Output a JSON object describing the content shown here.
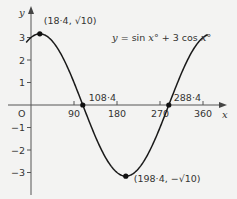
{
  "chart_data": {
    "type": "line",
    "title": "",
    "equation_label": {
      "y": "y",
      "eq": " = sin ",
      "x1": "x",
      "deg1": "° + 3 cos ",
      "x2": "x",
      "deg2": "°"
    },
    "xlabel": "x",
    "ylabel": "y",
    "origin_label": "O",
    "xlim": [
      0,
      360
    ],
    "ylim": [
      -3.5,
      3.5
    ],
    "x_ticks": [
      90,
      180,
      270,
      360
    ],
    "x_tick_labels": [
      "90",
      "180",
      "270",
      "360"
    ],
    "y_ticks": [
      -3,
      -2,
      -1,
      1,
      2,
      3
    ],
    "y_tick_labels": [
      "−3",
      "−2",
      "−1",
      "1",
      "2",
      "3"
    ],
    "function": "sin(x) + 3cos(x), x in degrees",
    "series": [
      {
        "name": "y = sin x° + 3 cos x°",
        "x_range": [
          -10,
          370
        ],
        "color": "#1a1a1a"
      }
    ],
    "points": [
      {
        "x": 18.4,
        "y": 3.162,
        "label": "(18·4, √10)"
      },
      {
        "x": 108.4,
        "y": 0,
        "label": "108·4"
      },
      {
        "x": 198.4,
        "y": -3.162,
        "label": "(198·4, −√10)"
      },
      {
        "x": 288.4,
        "y": 0,
        "label": "288·4"
      }
    ],
    "grid": false,
    "legend": "none"
  }
}
